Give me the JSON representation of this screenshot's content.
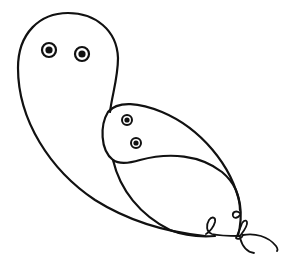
{
  "image": {
    "description": "Line drawing of two ghost-like figures with round eyes, tails joining in a curly string",
    "background_color": "#ffffff",
    "line_color": "#111111",
    "figures": [
      {
        "name": "large-ghost",
        "eye_count": 2
      },
      {
        "name": "small-ghost",
        "eye_count": 2
      }
    ],
    "ornament": "curly-string-tail"
  }
}
